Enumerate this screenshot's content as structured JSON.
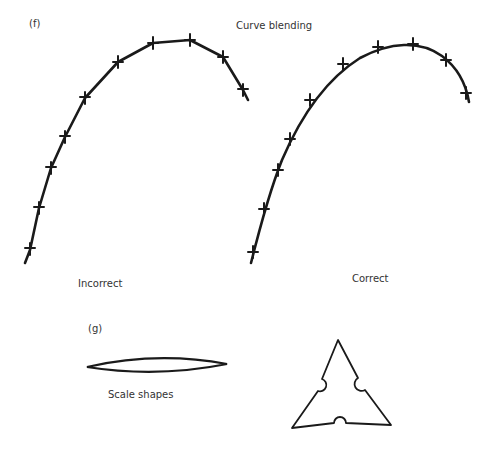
{
  "panel_f": {
    "label": "(f)",
    "title": "Curve blending",
    "incorrect_label": "Incorrect",
    "correct_label": "Correct"
  },
  "panel_g": {
    "label": "(g)",
    "caption": "Scale shapes"
  },
  "colors": {
    "stroke": "#1a1a1a",
    "text": "#333333",
    "background": "#ffffff"
  }
}
